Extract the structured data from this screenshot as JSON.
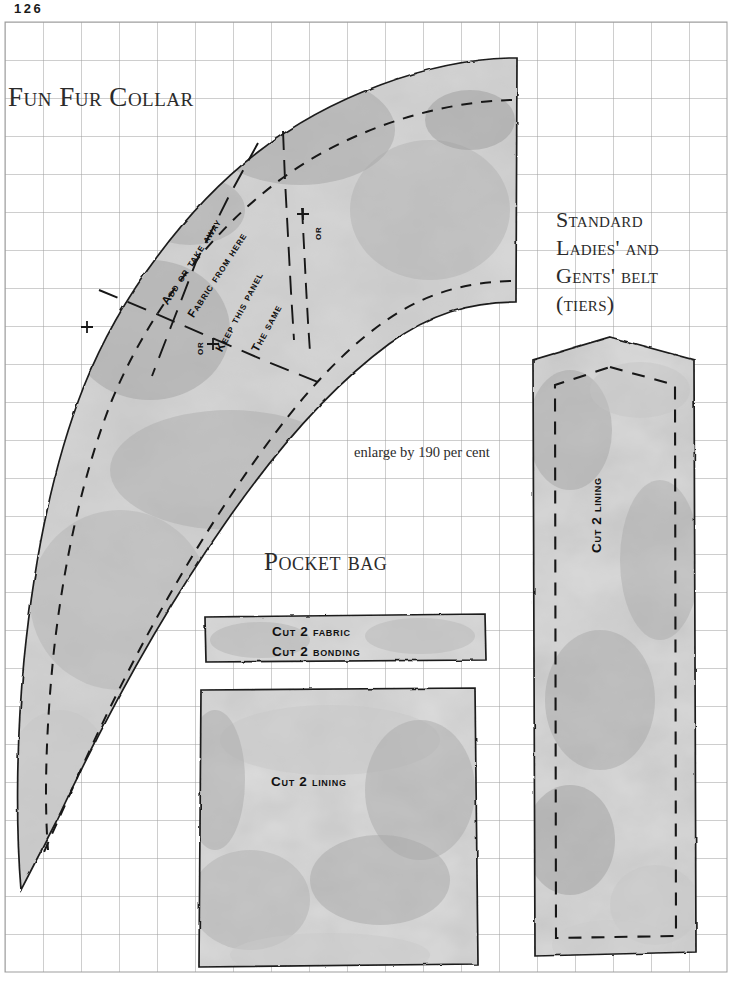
{
  "page": {
    "number": "126",
    "width": 733,
    "height": 996,
    "background": "#ffffff"
  },
  "grid": {
    "origin_x": 5,
    "origin_y": 22,
    "cell": 38,
    "cols": 19,
    "rows": 25,
    "color": "#9a9a9a",
    "note": "light grey scaling grid printed across whole page"
  },
  "headings": {
    "collar": "Fun Fur Collar",
    "belt_line1": "Standard",
    "belt_line2": "Ladies' and",
    "belt_line3": "Gents' belt",
    "belt_line4": "(tiers)",
    "pocket": "Pocket bag"
  },
  "notes": {
    "enlarge": "enlarge by 190 per cent"
  },
  "collar_annotations": [
    {
      "text": "Add or take away",
      "x": 159,
      "y": 300,
      "rotation": -57
    },
    {
      "text": "Fabric from here",
      "x": 185,
      "y": 313,
      "rotation": -57
    },
    {
      "text": "Keep this panel",
      "x": 213,
      "y": 348,
      "rotation": -62
    },
    {
      "text": "The same",
      "x": 249,
      "y": 348,
      "rotation": -62
    },
    {
      "text": "or",
      "x": 311,
      "y": 240,
      "rotation": -90
    },
    {
      "text": "or",
      "x": 193,
      "y": 355,
      "rotation": -90
    }
  ],
  "pieces": {
    "collar": {
      "name": "Fun Fur Collar",
      "fill": "#b4b4b4",
      "stroke": "#1f1f1f"
    },
    "belt": {
      "name": "Standard Ladies' and Gents' belt (tiers)",
      "label": "Cut 2 lining",
      "fill": "#b2b2b2",
      "stroke": "#1f1f1f"
    },
    "pocket_strip": {
      "name": "Pocket bag facing strip",
      "label_line1": "Cut 2 fabric",
      "label_line2": "Cut 2 bonding",
      "fill": "#bcbcbc",
      "stroke": "#1f1f1f"
    },
    "pocket_square": {
      "name": "Pocket bag lining square",
      "label": "Cut 2 lining",
      "fill": "#b8b8b8",
      "stroke": "#1f1f1f"
    }
  },
  "colors": {
    "ink": "#1f1f1f",
    "grid": "#9a9a9a",
    "paper": "#ffffff",
    "pattern_grey": "#b4b4b4",
    "heading_ink": "#2b2b2b"
  }
}
